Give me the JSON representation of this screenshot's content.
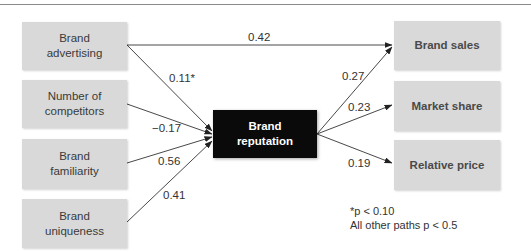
{
  "diagram": {
    "type": "path-model",
    "inputs": [
      {
        "id": "brand_advertising",
        "label": "Brand\nadvertising"
      },
      {
        "id": "number_of_competitors",
        "label": "Number of\ncompetitors"
      },
      {
        "id": "brand_familiarity",
        "label": "Brand\nfamiliarity"
      },
      {
        "id": "brand_uniqueness",
        "label": "Brand\nuniqueness"
      }
    ],
    "center": {
      "id": "brand_reputation",
      "label": "Brand\nreputation"
    },
    "outputs": [
      {
        "id": "brand_sales",
        "label": "Brand sales"
      },
      {
        "id": "market_share",
        "label": "Market share"
      },
      {
        "id": "relative_price",
        "label": "Relative price"
      }
    ],
    "edges": [
      {
        "from": "brand_advertising",
        "to": "brand_sales",
        "label": "0.42"
      },
      {
        "from": "brand_advertising",
        "to": "brand_reputation",
        "label": "0.11*"
      },
      {
        "from": "number_of_competitors",
        "to": "brand_reputation",
        "label": "−0.17"
      },
      {
        "from": "brand_familiarity",
        "to": "brand_reputation",
        "label": "0.56"
      },
      {
        "from": "brand_uniqueness",
        "to": "brand_reputation",
        "label": "0.41"
      },
      {
        "from": "brand_reputation",
        "to": "brand_sales",
        "label": "0.27"
      },
      {
        "from": "brand_reputation",
        "to": "market_share",
        "label": "0.23"
      },
      {
        "from": "brand_reputation",
        "to": "relative_price",
        "label": "0.19"
      }
    ],
    "footnote": {
      "line1": "*p < 0.10",
      "line2": "All other paths p < 0.5"
    }
  },
  "colors": {
    "node_fill": "#d9d9d9",
    "center_fill": "#0a0a0a",
    "center_text": "#ffffff",
    "text": "#333333",
    "edge": "#333333"
  }
}
